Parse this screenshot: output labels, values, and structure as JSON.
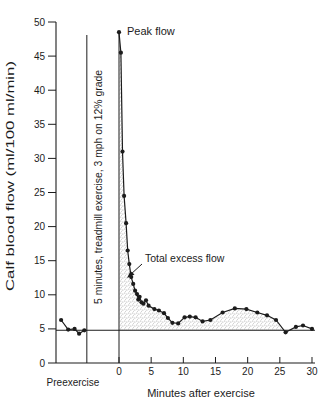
{
  "labels": {
    "peak_flow": "Peak flow",
    "total_excess_flow": "Total excess flow",
    "preexercise": "Preexercise",
    "exercise_band": "5 minutes, treadmill exercise, 3 mph on 12% grade"
  },
  "chart_data": {
    "type": "line",
    "title": "",
    "xlabel": "Minutes after exercise",
    "ylabel": "Calf blood flow (ml/100 ml/min)",
    "xlim": [
      -10,
      30.5
    ],
    "ylim": [
      0,
      50
    ],
    "x_ticks": [
      0,
      5,
      10,
      15,
      20,
      25,
      30
    ],
    "y_ticks": [
      0,
      5,
      10,
      15,
      20,
      25,
      30,
      35,
      40,
      45,
      50
    ],
    "grid": false,
    "legend": "none",
    "resting_baseline_flow": 4.8,
    "exercise_start_min": -5,
    "exercise_end_min": 0,
    "annotations": [
      "Peak flow",
      "Total excess flow"
    ],
    "series": [
      {
        "name": "preexercise",
        "points": [
          [
            -9.0,
            6.3
          ],
          [
            -7.9,
            4.9
          ],
          [
            -6.9,
            5.0
          ],
          [
            -6.2,
            4.3
          ],
          [
            -5.4,
            4.8
          ]
        ]
      },
      {
        "name": "recovery",
        "points": [
          [
            0.0,
            48.5
          ],
          [
            0.3,
            45.5
          ],
          [
            0.55,
            31.0
          ],
          [
            0.8,
            24.5
          ],
          [
            1.1,
            20.5
          ],
          [
            1.35,
            16.5
          ],
          [
            1.6,
            14.5
          ],
          [
            1.9,
            12.6
          ],
          [
            2.2,
            11.6
          ],
          [
            2.5,
            10.6
          ],
          [
            2.8,
            10.1
          ],
          [
            3.0,
            9.3
          ],
          [
            3.2,
            9.7
          ],
          [
            3.5,
            8.9
          ],
          [
            3.8,
            8.7
          ],
          [
            4.2,
            9.2
          ],
          [
            4.6,
            8.4
          ],
          [
            5.5,
            7.9
          ],
          [
            6.2,
            7.7
          ],
          [
            7.0,
            7.3
          ],
          [
            7.6,
            6.6
          ],
          [
            8.3,
            5.9
          ],
          [
            9.2,
            5.8
          ],
          [
            10.2,
            6.7
          ],
          [
            11.0,
            6.8
          ],
          [
            11.9,
            6.7
          ],
          [
            13.0,
            6.1
          ],
          [
            14.2,
            6.3
          ],
          [
            16.1,
            7.4
          ],
          [
            18.0,
            8.0
          ],
          [
            19.8,
            7.9
          ],
          [
            21.5,
            7.4
          ],
          [
            23.0,
            7.0
          ],
          [
            24.4,
            6.3
          ],
          [
            25.9,
            4.5
          ],
          [
            27.5,
            5.3
          ],
          [
            28.6,
            5.5
          ],
          [
            30.0,
            5.0
          ]
        ]
      }
    ],
    "colors": {
      "ink": "#1c1c1c",
      "stipple": "#8d8d8d",
      "background": "#ffffff"
    }
  }
}
